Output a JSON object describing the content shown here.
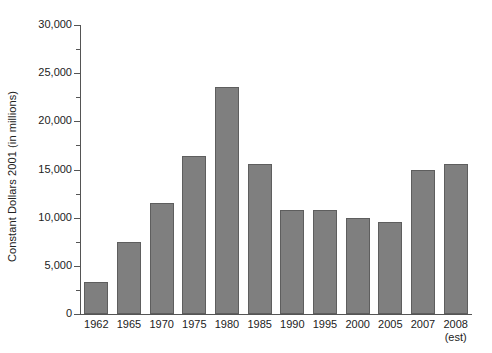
{
  "chart_data": {
    "type": "bar",
    "title": "",
    "xlabel": "",
    "ylabel": "Constant Dollars 2001 (in millions)",
    "categories": [
      "1962",
      "1965",
      "1970",
      "1975",
      "1980",
      "1985",
      "1990",
      "1995",
      "2000",
      "2005",
      "2007",
      "2008"
    ],
    "category_sublabels": [
      "",
      "",
      "",
      "",
      "",
      "",
      "",
      "",
      "",
      "",
      "",
      "(est)"
    ],
    "values": [
      3300,
      7500,
      11500,
      16400,
      23600,
      15600,
      10800,
      10800,
      10000,
      9600,
      15000,
      15600
    ],
    "ylim": [
      0,
      30000
    ],
    "ytick_values": [
      0,
      5000,
      10000,
      15000,
      20000,
      25000,
      30000
    ],
    "ytick_labels": [
      "0",
      "5,000",
      "10,000",
      "15,000",
      "20,000",
      "25,000",
      "30,000"
    ],
    "yminor_tick_values": [
      2500,
      7500,
      12500,
      17500,
      22500,
      27500
    ],
    "grid": false,
    "legend": null,
    "bar_color": "#7f7f7f",
    "bar_edge_color": "#5e5e5e",
    "axis_color": "#555555",
    "background_color": "#ffffff"
  }
}
